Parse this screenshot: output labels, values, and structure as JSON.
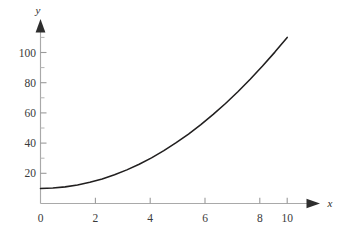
{
  "chart_data": {
    "type": "line",
    "title": "",
    "subtitle": "",
    "xlabel": "x",
    "ylabel": "y",
    "xlim": [
      0,
      10.4
    ],
    "ylim": [
      0,
      118
    ],
    "grid": false,
    "legend": null,
    "legend_position": "none",
    "x_ticks": [
      0,
      2,
      4,
      6,
      8,
      10
    ],
    "x_tick_labels": [
      "0",
      "2",
      "4",
      "6",
      "8",
      "10"
    ],
    "x_minor_ticks": [],
    "y_ticks": [
      20,
      40,
      60,
      80,
      100
    ],
    "y_tick_labels": [
      "20",
      "40",
      "60",
      "80",
      "100"
    ],
    "y_minor_ticks": [
      10,
      30,
      50,
      70,
      90,
      110
    ],
    "axis_style": "arrow-tipped single quadrant",
    "series": [
      {
        "name": "curve",
        "color": "#211f1f",
        "x": [
          0,
          0.5,
          1,
          1.5,
          2,
          2.5,
          3,
          3.5,
          4,
          4.5,
          5,
          5.5,
          6,
          6.5,
          7,
          7.5,
          8,
          8.5,
          9,
          9.5,
          10
        ],
        "values": [
          10,
          10.25,
          11,
          12.25,
          14,
          16.25,
          19,
          22.25,
          26,
          30.25,
          35,
          40.25,
          46,
          52.25,
          59,
          66.25,
          74,
          82.25,
          91,
          100.25,
          110
        ]
      }
    ],
    "annotations": []
  },
  "axes": {
    "y_axis_label": "y",
    "x_axis_label": "x",
    "axis_color": "#a9a9a9",
    "arrow_color": "#2e2e2e",
    "tick_label_color": "#3a3a3a",
    "curve_color": "#211f1f",
    "background_color": "#ffffff"
  },
  "icons": {
    "y_axis_arrow": "arrow-up-icon",
    "x_axis_arrow": "arrow-right-icon"
  }
}
